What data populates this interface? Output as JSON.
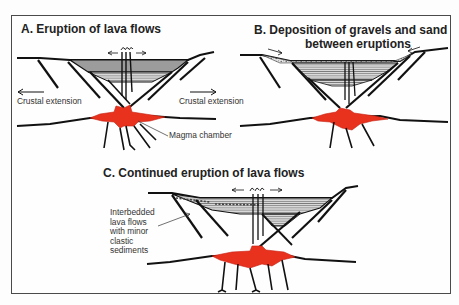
{
  "figure": {
    "panels": [
      {
        "id": "A",
        "title": "A. Eruption of lava flows",
        "labels": {
          "left_extension": "Crustal extension",
          "right_extension": "Crustal extension",
          "magma": "Magma chamber"
        }
      },
      {
        "id": "B",
        "title_line1": "B. Deposition of gravels and sand",
        "title_line2": "between eruptions"
      },
      {
        "id": "C",
        "title": "C. Continued eruption of lava flows",
        "annotation_lines": [
          "Interbedded",
          "lava flows",
          "with minor",
          "clastic",
          "sediments"
        ]
      }
    ],
    "colors": {
      "magma": "#e8321e",
      "lava_fill": "#9a9a9a",
      "sediment_fill": "#d6d6d6",
      "line": "#111111",
      "frame": "#4a4a4a"
    }
  }
}
